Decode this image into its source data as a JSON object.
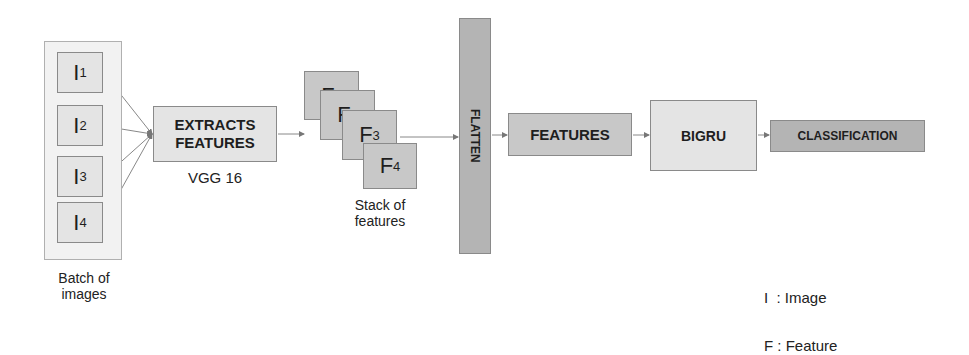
{
  "batch": {
    "images": [
      {
        "letter": "I",
        "sub": "1"
      },
      {
        "letter": "I",
        "sub": "2"
      },
      {
        "letter": "I",
        "sub": "3"
      },
      {
        "letter": "I",
        "sub": "4"
      }
    ],
    "caption_line1": "Batch of",
    "caption_line2": "images"
  },
  "extractor": {
    "line1": "EXTRACTS",
    "line2": "FEATURES",
    "caption": "VGG 16"
  },
  "stack": {
    "features": [
      {
        "letter": "F",
        "sub": "1"
      },
      {
        "letter": "F",
        "sub": "2"
      },
      {
        "letter": "F",
        "sub": "3"
      },
      {
        "letter": "F",
        "sub": "4"
      }
    ],
    "caption_line1": "Stack of",
    "caption_line2": "features"
  },
  "flatten": {
    "label": "FLATTEN"
  },
  "features_box": {
    "label": "FEATURES"
  },
  "bigru": {
    "label": "BIGRU"
  },
  "classification": {
    "label": "CLASSIFICATION"
  },
  "legend": {
    "line1": "I  : Image",
    "line2": "F : Feature"
  },
  "colors": {
    "light_fill": "#e4e4e4",
    "mid_fill": "#c8c8c8",
    "dark_fill": "#b4b4b4",
    "stroke": "#8a8a8a"
  }
}
